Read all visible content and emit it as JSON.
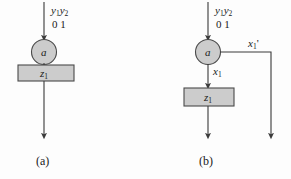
{
  "figure": {
    "background_color": "#fdfdfd",
    "stroke_color": "#3a3a3a",
    "node_fill_color": "#cccccc",
    "box_fill_color": "#cccccc"
  },
  "panels": [
    {
      "id": "a",
      "caption": "(a)",
      "input_label": {
        "y1": "y",
        "y1_sub": "1",
        "y2": "y",
        "y2_sub": "2"
      },
      "input_values": "0  1",
      "state_node": "a",
      "output_box": {
        "text": "z",
        "sub": "1"
      },
      "edges": [
        {
          "name": "incoming-transition-arrow",
          "direction": "down"
        },
        {
          "name": "outgoing-transition-arrow",
          "direction": "down"
        }
      ]
    },
    {
      "id": "b",
      "caption": "(b)",
      "input_label": {
        "y1": "y",
        "y1_sub": "1",
        "y2": "y",
        "y2_sub": "2"
      },
      "input_values": "0  1",
      "state_node": "a",
      "output_box": {
        "text": "z",
        "sub": "1"
      },
      "branch_down_label": {
        "text": "x",
        "sub": "1"
      },
      "branch_right_label": {
        "text": "x",
        "sub": "1",
        "prime": "'"
      },
      "edges": [
        {
          "name": "incoming-transition-arrow",
          "direction": "down"
        },
        {
          "name": "x1-branch-arrow",
          "direction": "down"
        },
        {
          "name": "x1-prime-branch-arrow",
          "direction": "right-then-down"
        },
        {
          "name": "outgoing-transition-arrow",
          "direction": "down"
        }
      ]
    }
  ]
}
